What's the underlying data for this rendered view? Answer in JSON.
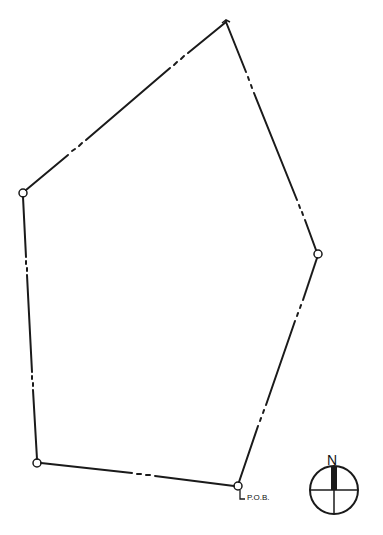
{
  "diagram": {
    "type": "survey-plat-boundary",
    "line_color": "#1a1a1a",
    "background": "#ffffff",
    "vertices": [
      {
        "id": "A",
        "x": 226,
        "y": 22,
        "marker": "none"
      },
      {
        "id": "B",
        "x": 318,
        "y": 254,
        "marker": "circle"
      },
      {
        "id": "C",
        "x": 238,
        "y": 486,
        "marker": "circle"
      },
      {
        "id": "D",
        "x": 37,
        "y": 463,
        "marker": "circle"
      },
      {
        "id": "E",
        "x": 23,
        "y": 193,
        "marker": "circle"
      }
    ],
    "edges": [
      {
        "from": "A",
        "to": "B",
        "style": "dash-dot break"
      },
      {
        "from": "B",
        "to": "C",
        "style": "dash-dot break"
      },
      {
        "from": "C",
        "to": "D",
        "style": "dash-dot break"
      },
      {
        "from": "D",
        "to": "E",
        "style": "dash-dot break"
      },
      {
        "from": "E",
        "to": "A",
        "style": "dash-dot break"
      }
    ],
    "pob_label": "P.O.B.",
    "north_arrow": {
      "label": "N",
      "cx": 334,
      "cy": 490,
      "r": 24
    }
  }
}
